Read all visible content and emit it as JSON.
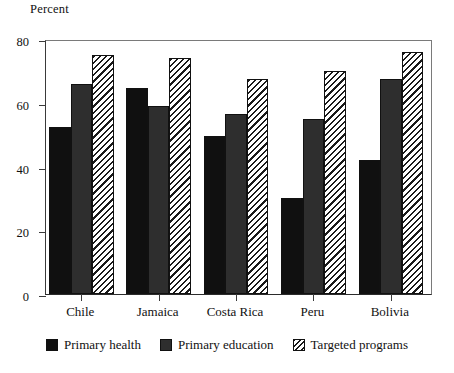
{
  "chart_data": {
    "type": "bar",
    "title": "",
    "subtitle": "",
    "xlabel": "",
    "ylabel": "Percent",
    "ylim": [
      0,
      80
    ],
    "yticks": [
      0,
      20,
      40,
      60,
      80
    ],
    "grid": false,
    "legend_position": "bottom",
    "categories": [
      "Chile",
      "Jamaica",
      "Costa Rica",
      "Peru",
      "Bolivia"
    ],
    "series": [
      {
        "name": "Primary health",
        "color": "#101010",
        "pattern": "solid-black",
        "values": [
          52.5,
          64.5,
          49.5,
          30.0,
          42.0
        ]
      },
      {
        "name": "Primary education",
        "color": "#2e2e2e",
        "pattern": "solid-dark-gray",
        "values": [
          66.0,
          59.0,
          56.5,
          55.0,
          67.5
        ]
      },
      {
        "name": "Targeted programs",
        "color": "#1a1a1a",
        "pattern": "diagonal-hatch",
        "values": [
          75.0,
          74.0,
          67.5,
          70.0,
          76.0
        ]
      }
    ]
  },
  "legend": {
    "items": [
      {
        "label": "Primary health",
        "swatch": "solid-black-swatch"
      },
      {
        "label": "Primary education",
        "swatch": "solid-gray-swatch"
      },
      {
        "label": "Targeted programs",
        "swatch": "hatched-swatch"
      }
    ]
  }
}
